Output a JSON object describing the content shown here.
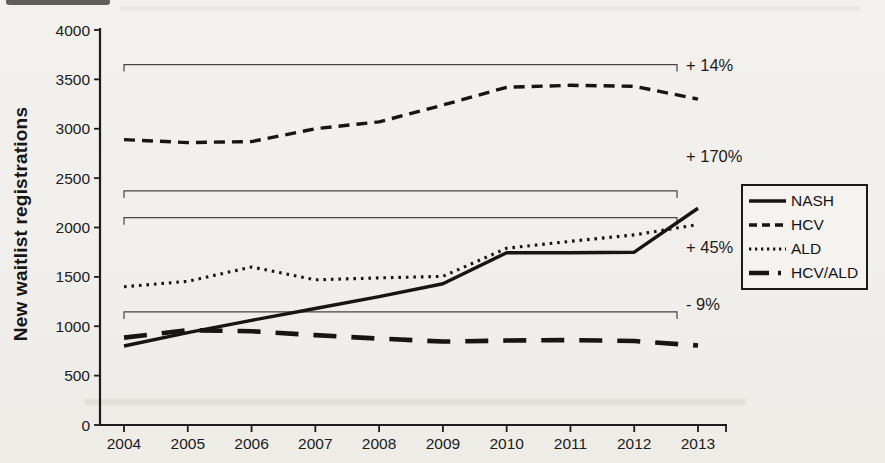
{
  "chart_data": {
    "type": "line",
    "title": "",
    "xlabel": "",
    "ylabel": "New waitlist registrations",
    "x": [
      2004,
      2005,
      2006,
      2007,
      2008,
      2009,
      2010,
      2011,
      2012,
      2013
    ],
    "ylim": [
      0,
      4000
    ],
    "y_ticks": [
      0,
      500,
      1000,
      1500,
      2000,
      2500,
      3000,
      3500,
      4000
    ],
    "grid": false,
    "legend_position": "right",
    "series": [
      {
        "name": "NASH",
        "line_style": "solid",
        "values": [
          800,
          935,
          1060,
          1180,
          1300,
          1430,
          1745,
          1745,
          1750,
          2195
        ]
      },
      {
        "name": "HCV",
        "line_style": "dashed",
        "values": [
          2890,
          2860,
          2870,
          3000,
          3070,
          3240,
          3420,
          3440,
          3430,
          3300
        ]
      },
      {
        "name": "ALD",
        "line_style": "dotted",
        "values": [
          1400,
          1455,
          1600,
          1470,
          1490,
          1505,
          1790,
          1860,
          1925,
          2030
        ]
      },
      {
        "name": "HCV/ALD",
        "line_style": "long-dash-dot",
        "values": [
          885,
          960,
          950,
          910,
          875,
          845,
          855,
          860,
          850,
          805
        ]
      }
    ],
    "annotations": [
      {
        "label": "+ 14%",
        "bracket_level": 3650,
        "label_level": 3650
      },
      {
        "label": "+ 170%",
        "bracket_level": 2370,
        "label_level": 2720
      },
      {
        "label": "+ 45%",
        "bracket_level": 2100,
        "label_level": 1800
      },
      {
        "label": "- 9%",
        "bracket_level": 1145,
        "label_level": 1230
      }
    ]
  }
}
